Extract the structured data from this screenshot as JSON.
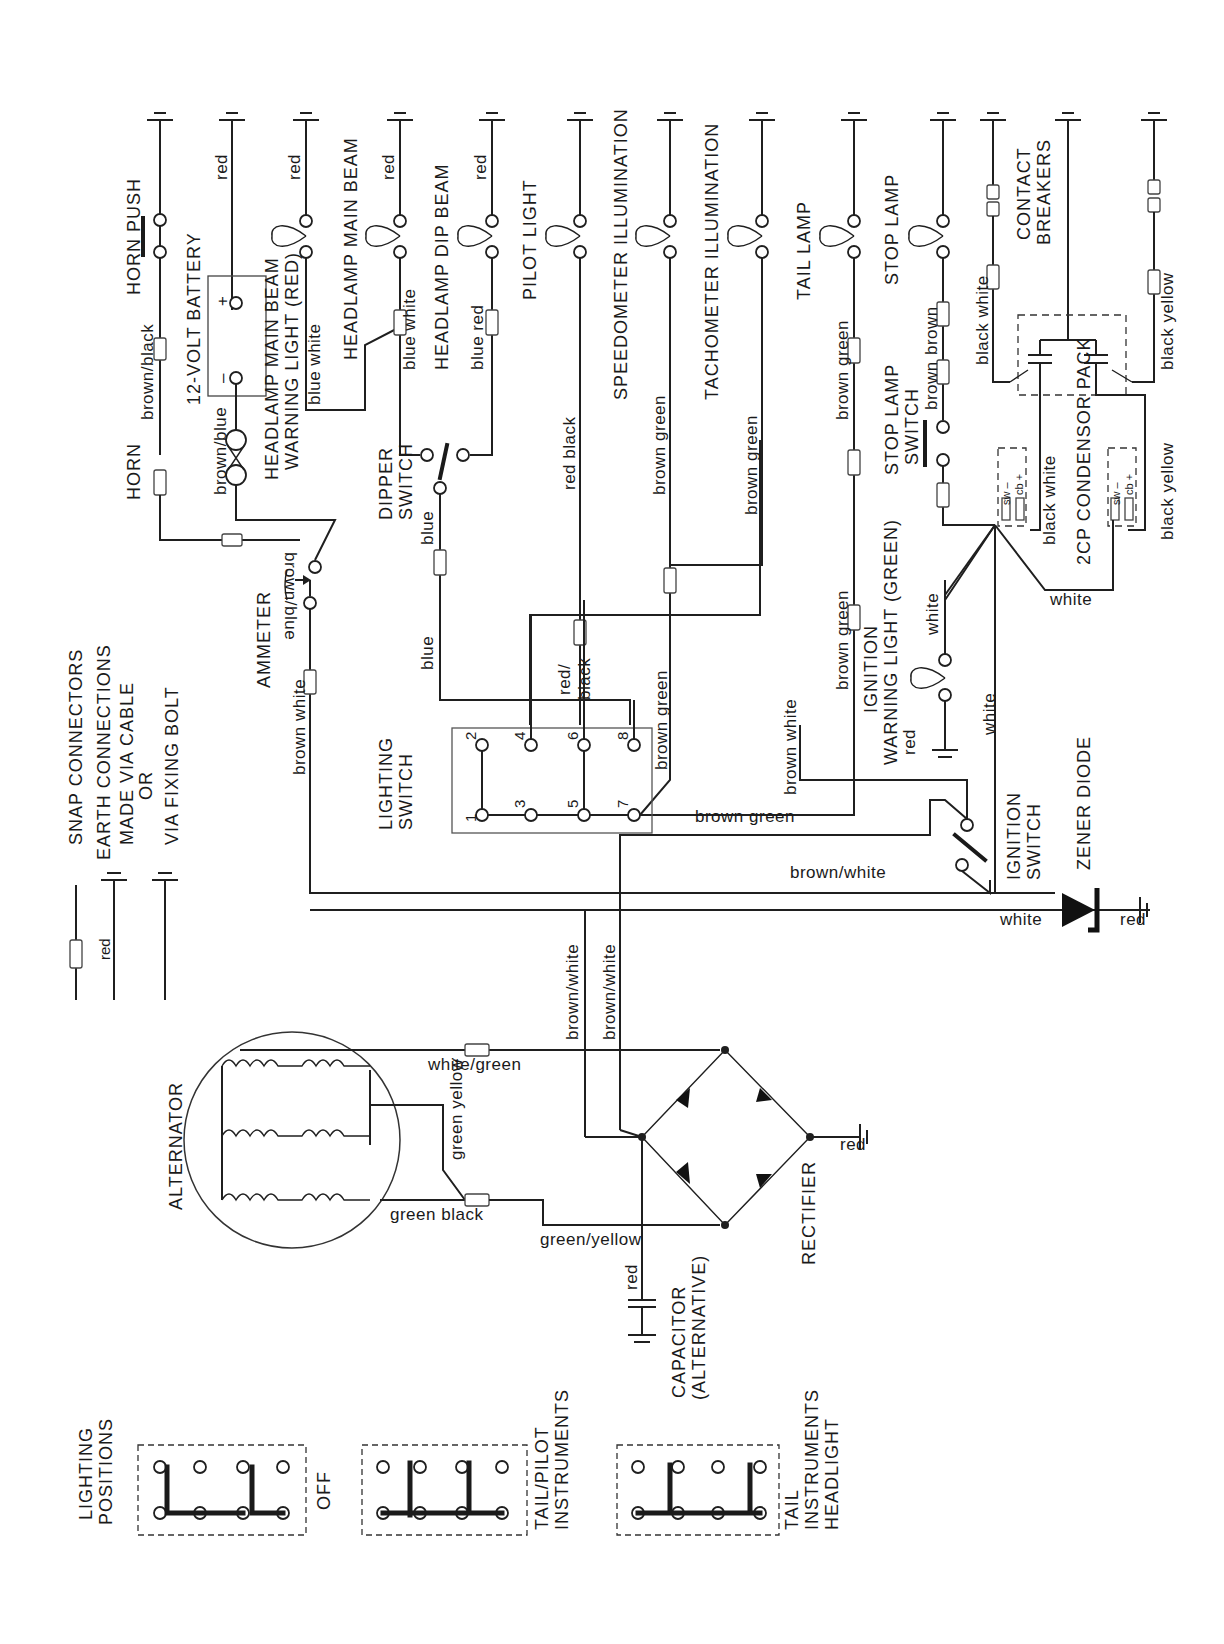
{
  "diagram": {
    "legend": {
      "snap_connectors": "SNAP CONNECTORS",
      "earth_line1": "EARTH CONNECTIONS",
      "earth_line2": "MADE VIA CABLE",
      "earth_or": "OR",
      "earth_bolt": "VIA FIXING BOLT",
      "earth_wire": "red"
    },
    "components": {
      "horn": "HORN",
      "horn_push": "HORN PUSH",
      "battery": "12-VOLT BATTERY",
      "battery_neg": "–",
      "battery_pos": "+",
      "hl_warn_1": "HEADLAMP MAIN BEAM",
      "hl_warn_2": "WARNING LIGHT (RED)",
      "hl_main": "HEADLAMP MAIN BEAM",
      "hl_dip": "HEADLAMP DIP BEAM",
      "dipper_1": "DIPPER",
      "dipper_2": "SWITCH",
      "pilot": "PILOT LIGHT",
      "speedo": "SPEEDOMETER  ILLUMINATION",
      "tacho": "TACHOMETER  ILLUMINATION",
      "tail": "TAIL  LAMP",
      "stop": "STOP  LAMP",
      "stop_sw_1": "STOP LAMP",
      "stop_sw_2": "SWITCH",
      "contact_1": "CONTACT",
      "contact_2": "BREAKERS",
      "condenser": "2CP CONDENSOR PACK",
      "coil_sw": "sw –",
      "coil_cb": "cb +",
      "ammeter": "AMMETER",
      "lighting_sw_1": "LIGHTING",
      "lighting_sw_2": "SWITCH",
      "ign_warn_1": "IGNITION",
      "ign_warn_2": "WARNING LIGHT (GREEN)",
      "ign_sw_1": "IGNITION",
      "ign_sw_2": "SWITCH",
      "zener": "ZENER DIODE",
      "alternator": "ALTERNATOR",
      "rectifier": "RECTIFIER",
      "capacitor_1": "CAPACITOR",
      "capacitor_2": "(ALTERNATIVE)"
    },
    "wires": {
      "red": "red",
      "brown_black": "brown/black",
      "brown_blue": "brown/blue",
      "blue_white": "blue  white",
      "blue_red": "blue  red",
      "blue": "blue",
      "red_black": "red  black",
      "red_slash": "red/",
      "black": "black",
      "brown_green": "brown  green",
      "brown": "brown",
      "black_white": "black  white",
      "black_yellow": "black  yellow",
      "brown_white": "brown  white",
      "brown_white_slash": "brown/white",
      "white": "white",
      "white_green": "white/green",
      "green_yellow": "green  yellow",
      "green_black": "green  black",
      "green_yellow2": "green/yellow"
    },
    "terminals": [
      "1",
      "2",
      "3",
      "4",
      "5",
      "6",
      "7",
      "8"
    ],
    "lighting_positions": {
      "title_1": "LIGHTING",
      "title_2": "POSITIONS",
      "positions": [
        {
          "label_1": "OFF",
          "label_2": "",
          "label_3": ""
        },
        {
          "label_1": "TAIL/PILOT",
          "label_2": "INSTRUMENTS",
          "label_3": ""
        },
        {
          "label_1": "TAIL",
          "label_2": "INSTRUMENTS",
          "label_3": "HEADLIGHT"
        }
      ]
    }
  }
}
